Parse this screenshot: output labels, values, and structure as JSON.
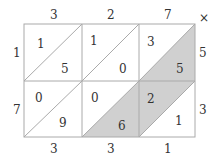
{
  "operator": "×",
  "top_digits": [
    "3",
    "2",
    "7"
  ],
  "right_digits": [
    "5",
    "3"
  ],
  "left_digits": [
    "1",
    "7"
  ],
  "bottom_digits": [
    "3",
    "3",
    "1"
  ],
  "cells": [
    [
      {
        "tens": "1",
        "ones": "5"
      },
      {
        "tens": "1",
        "ones": "0"
      },
      {
        "tens": "3",
        "ones": "5"
      }
    ],
    [
      {
        "tens": "0",
        "ones": "9"
      },
      {
        "tens": "0",
        "ones": "6"
      },
      {
        "tens": "2",
        "ones": "1"
      }
    ]
  ],
  "colors": {
    "shade": "#d0d0d0",
    "line": "#aaaaaa",
    "text": "#333333"
  }
}
